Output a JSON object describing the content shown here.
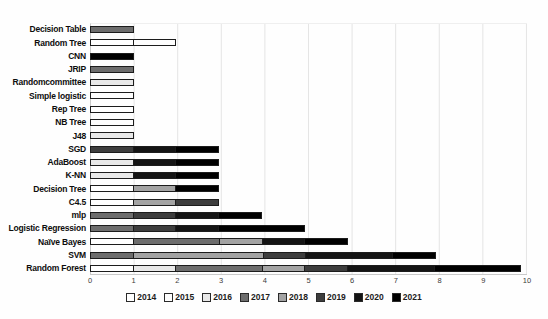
{
  "chart_data": {
    "type": "bar",
    "orientation": "horizontal",
    "stacked": true,
    "title": "",
    "xlabel": "",
    "ylabel": "",
    "categories": [
      "Decision Table",
      "Random Tree",
      "CNN",
      "JRIP",
      "Randomcommittee",
      "Simple logistic",
      "Rep Tree",
      "NB Tree",
      "J48",
      "SGD",
      "AdaBoost",
      "K-NN",
      "Decision Tree",
      "C4.5",
      "mlp",
      "Logistic Regression",
      "Naïve Bayes",
      "SVM",
      "Random Forest"
    ],
    "series": [
      {
        "name": "2014",
        "color": "#ffffff",
        "values": [
          0,
          1,
          0,
          0,
          0,
          0,
          1,
          0,
          0,
          0,
          0,
          0,
          1,
          1,
          0,
          0,
          1,
          0,
          1
        ]
      },
      {
        "name": "2015",
        "color": "#fdfdfd",
        "values": [
          0,
          1,
          0,
          0,
          0,
          1,
          0,
          1,
          0,
          0,
          0,
          0,
          0,
          0,
          0,
          0,
          0,
          0,
          0
        ]
      },
      {
        "name": "2016",
        "color": "#e8e8e8",
        "values": [
          0,
          0,
          0,
          0,
          1,
          0,
          0,
          0,
          1,
          0,
          1,
          1,
          0,
          0,
          0,
          0,
          0,
          0,
          1
        ]
      },
      {
        "name": "2017",
        "color": "#6d6d6d",
        "values": [
          1,
          0,
          0,
          1,
          0,
          0,
          0,
          0,
          0,
          0,
          0,
          0,
          0,
          0,
          1,
          1,
          2,
          1,
          2
        ]
      },
      {
        "name": "2018",
        "color": "#a3a3a3",
        "values": [
          0,
          0,
          0,
          0,
          0,
          0,
          0,
          0,
          0,
          0,
          0,
          0,
          1,
          1,
          0,
          0,
          1,
          3,
          1
        ]
      },
      {
        "name": "2019",
        "color": "#3d3d3d",
        "values": [
          0,
          0,
          0,
          0,
          0,
          0,
          0,
          0,
          0,
          1,
          0,
          0,
          0,
          1,
          1,
          1,
          0,
          1,
          1
        ]
      },
      {
        "name": "2020",
        "color": "#141414",
        "values": [
          0,
          0,
          0,
          0,
          0,
          0,
          0,
          0,
          0,
          1,
          1,
          1,
          0,
          0,
          1,
          1,
          1,
          2,
          2
        ]
      },
      {
        "name": "2021",
        "color": "#000000",
        "values": [
          0,
          0,
          1,
          0,
          0,
          0,
          0,
          0,
          0,
          1,
          1,
          1,
          1,
          0,
          1,
          2,
          1,
          1,
          2
        ]
      }
    ],
    "totals": [
      1,
      2,
      1,
      1,
      1,
      1,
      1,
      1,
      1,
      3,
      3,
      3,
      3,
      3,
      4,
      5,
      6,
      8,
      10
    ],
    "xlim": [
      0,
      10
    ],
    "x_ticks": [
      "0",
      "1",
      "2",
      "3",
      "4",
      "5",
      "6",
      "7",
      "8",
      "9",
      "10"
    ],
    "grid": "vertical",
    "legend_position": "bottom"
  }
}
